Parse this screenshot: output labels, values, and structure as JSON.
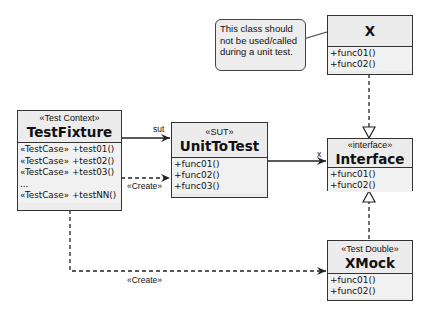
{
  "note": {
    "lines": [
      "This class should",
      "not be used/called",
      "during a unit test."
    ]
  },
  "classes": {
    "x": {
      "stereotype": "",
      "name": "X",
      "operations": [
        "+func01()",
        "+func02()"
      ]
    },
    "test_fixture": {
      "stereotype": "«Test Context»",
      "name": "TestFixture",
      "operations": [
        "«TestCase» +test01()",
        "«TestCase» +test02()",
        "«TestCase» +test03()",
        "...",
        "«TestCase» +testNN()"
      ]
    },
    "unit_to_test": {
      "stereotype": "«SUT»",
      "name": "UnitToTest",
      "operations": [
        "+func01()",
        "+func02()",
        "+func03()"
      ]
    },
    "interface": {
      "stereotype": "«interface»",
      "name": "Interface",
      "operations": [
        "+func01()",
        "+func02()"
      ]
    },
    "xmock": {
      "stereotype": "«Test Double»",
      "name": "XMock",
      "operations": [
        "+func01()",
        "+func02()"
      ]
    }
  },
  "relations": {
    "sut_label": "sut",
    "x_label": "x",
    "create_label_1": "«Create»",
    "create_label_2": "«Create»"
  },
  "colors": {
    "box_fill": "#ececec",
    "border": "#333333",
    "background": "#ffffff"
  }
}
